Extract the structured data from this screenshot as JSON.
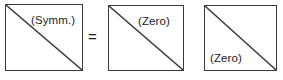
{
  "figure": {
    "background_color": "#ffffff",
    "line_color": "#3a3a3a",
    "text_color": "#1c1c1c"
  },
  "blocks": [
    {
      "id": "block-1",
      "label": "(Symm.)",
      "label_region": "upper-right",
      "diagonal": "top-left-to-bottom-right"
    },
    {
      "id": "block-2",
      "label": "(Zero)",
      "label_region": "upper-right",
      "diagonal": "top-left-to-bottom-right"
    },
    {
      "id": "block-3",
      "label": "(Zero)",
      "label_region": "lower-left",
      "diagonal": "top-left-to-bottom-right"
    }
  ],
  "operators": {
    "equals": "="
  }
}
